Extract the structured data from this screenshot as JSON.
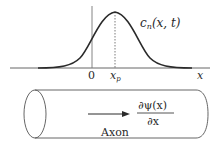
{
  "plot": {
    "curve_label_base": "c",
    "curve_label_sub": "n",
    "curve_label_args": "(x, t)",
    "origin_label": "0",
    "peak_label_base": "x",
    "peak_label_sub": "p",
    "axis_label": "x"
  },
  "axon": {
    "label": "Axon",
    "derivative_numerator": "∂ψ(x)",
    "derivative_denominator": "∂x"
  },
  "colors": {
    "ink": "#2a2a2a",
    "axis": "#555555"
  }
}
